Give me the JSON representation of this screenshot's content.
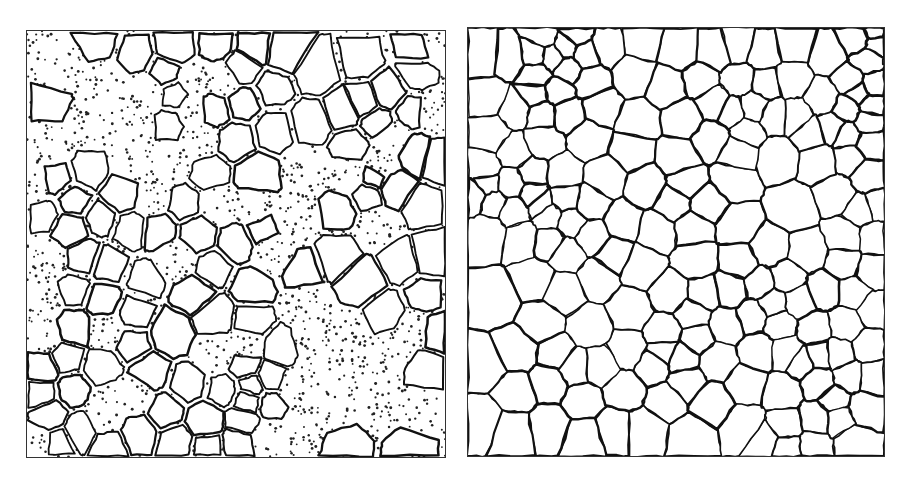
{
  "figure": {
    "panels": [
      {
        "id": "left",
        "description": "Rounded grains separated by dark boundaries, embedded in a dotted (stippled) matrix",
        "style": "grains-in-stippled-matrix",
        "boundary_color": "#111111",
        "background_color": "#ffffff",
        "seed": 7,
        "grain_count": 150,
        "matrix_fraction": 0.35
      },
      {
        "id": "right",
        "description": "Fully packed polygonal grains with dark irregular grain boundaries (no matrix)",
        "style": "polygonal-grain-network",
        "boundary_color": "#111111",
        "background_color": "#ffffff",
        "seed": 13,
        "grain_count": 180
      }
    ]
  }
}
